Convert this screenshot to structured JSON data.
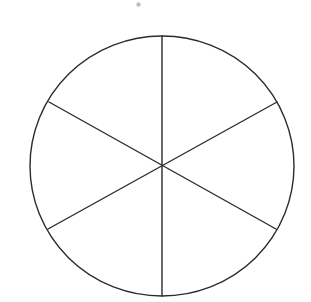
{
  "figure": {
    "title": "Circle divided into six equal sectors",
    "background_color": "#ffffff",
    "stroke_color": "#2b2b2b",
    "stroke_width": 1.4,
    "canvas": {
      "width": 311,
      "height": 302
    },
    "circle": {
      "label": "outer-circle",
      "center_x": 162,
      "center_y": 166,
      "radius_x": 132,
      "radius_y": 130
    },
    "sector_count": 6,
    "sector_angle_degrees": 60,
    "diameters": [
      {
        "label": "vertical-diameter",
        "angle_degrees": 90,
        "x1": 162,
        "y1": 36,
        "x2": 162,
        "y2": 296
      },
      {
        "label": "upper-left-to-lower-right-diameter",
        "angle_degrees": 30,
        "x1": 49,
        "y1": 102,
        "x2": 276,
        "y2": 229
      },
      {
        "label": "lower-left-to-upper-right-diameter",
        "angle_degrees": 150,
        "x1": 48,
        "y1": 229,
        "x2": 277,
        "y2": 102
      }
    ],
    "vertices": [
      {
        "label": "top-vertex",
        "x": 162,
        "y": 36
      },
      {
        "label": "upper-right-vertex",
        "x": 277,
        "y": 102
      },
      {
        "label": "lower-right-vertex",
        "x": 276,
        "y": 229
      },
      {
        "label": "bottom-vertex",
        "x": 162,
        "y": 296
      },
      {
        "label": "lower-left-vertex",
        "x": 48,
        "y": 229
      },
      {
        "label": "upper-left-vertex",
        "x": 49,
        "y": 102
      }
    ],
    "center_point": {
      "label": "center-intersection",
      "x": 162,
      "y": 166
    },
    "artifacts": [
      {
        "label": "scan-speck",
        "x": 136,
        "y": 2,
        "color": "#9a9a9a"
      }
    ]
  }
}
